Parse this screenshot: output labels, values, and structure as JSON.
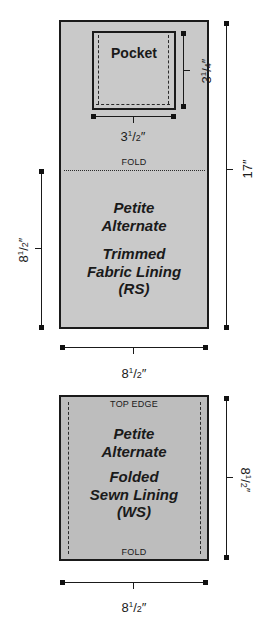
{
  "top_panel": {
    "pocket": {
      "label": "Pocket",
      "width_dim": {
        "whole": "3",
        "num": "1",
        "den": "2",
        "unit": "″"
      },
      "height_dim": {
        "whole": "3",
        "num": "1",
        "den": "4",
        "unit": "″"
      }
    },
    "fold_label": "FOLD",
    "title_lines": [
      "Petite",
      "Alternate"
    ],
    "subtitle_lines": [
      "Trimmed",
      "Fabric Lining",
      "(RS)"
    ],
    "height_dim": {
      "whole": "17",
      "unit": "″"
    },
    "half_height_dim": {
      "whole": "8",
      "num": "1",
      "den": "2",
      "unit": "″"
    },
    "width_dim": {
      "whole": "8",
      "num": "1",
      "den": "2",
      "unit": "″"
    },
    "fill_color": "#c9c9c9"
  },
  "bottom_panel": {
    "top_label": "TOP EDGE",
    "bottom_label": "FOLD",
    "title_lines": [
      "Petite",
      "Alternate"
    ],
    "subtitle_lines": [
      "Folded",
      "Sewn Lining",
      "(WS)"
    ],
    "height_dim": {
      "whole": "8",
      "num": "1",
      "den": "2",
      "unit": "″"
    },
    "width_dim": {
      "whole": "8",
      "num": "1",
      "den": "2",
      "unit": "″"
    },
    "fill_color": "#bdbdbd"
  }
}
